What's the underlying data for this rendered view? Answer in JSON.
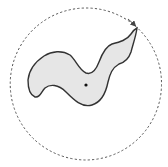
{
  "diagram": {
    "type": "region-with-bounding-circle",
    "elements": {
      "bounding_circle": {
        "style": "dashed",
        "color": "#555555",
        "has_arrow": true
      },
      "region": {
        "fill": "#e6e6e6",
        "stroke": "#333333"
      },
      "center_point": {
        "color": "#111111"
      }
    },
    "labels": []
  }
}
